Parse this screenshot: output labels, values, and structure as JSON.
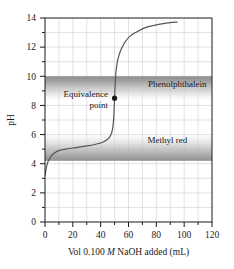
{
  "chart_data": {
    "type": "line",
    "title": "",
    "xlabel": "Vol 0.100 M NaOH added (mL)",
    "xlabel_parts": {
      "pre": "Vol 0.100 ",
      "italic": "M",
      "post": " NaOH added (mL)"
    },
    "ylabel": "pH",
    "xlim": [
      0,
      120
    ],
    "ylim": [
      0,
      14
    ],
    "xticks": [
      0,
      20,
      40,
      60,
      80,
      100,
      120
    ],
    "xtick_labels": [
      "0",
      "20",
      "40",
      "60",
      "80",
      "100",
      "120"
    ],
    "xminor_ticks": [
      10,
      30,
      50,
      70,
      90,
      110
    ],
    "yticks": [
      0,
      2,
      4,
      6,
      8,
      10,
      12,
      14
    ],
    "ytick_labels": [
      "0",
      "2",
      "4",
      "6",
      "8",
      "10",
      "12",
      "14"
    ],
    "yminor_ticks": [
      1,
      3,
      5,
      7,
      9,
      11,
      13
    ],
    "grid": true,
    "grid_x_step": 10,
    "grid_y_step": 1,
    "legend_position": "none",
    "series": [
      {
        "name": "Titration curve of weak acid with 0.100 M NaOH",
        "color": "#555555",
        "x": [
          0,
          1,
          2,
          3,
          4,
          5,
          7,
          10,
          15,
          20,
          25,
          30,
          35,
          40,
          43,
          45,
          46,
          47,
          48,
          49,
          49.5,
          50,
          50.5,
          51,
          52,
          53,
          54,
          55,
          56,
          57,
          58,
          60,
          62,
          65,
          68,
          70,
          75,
          80,
          85,
          90,
          95
        ],
        "y": [
          3.2,
          3.75,
          4.1,
          4.3,
          4.45,
          4.58,
          4.75,
          4.9,
          5.0,
          5.08,
          5.15,
          5.22,
          5.3,
          5.42,
          5.55,
          5.68,
          5.78,
          5.92,
          6.15,
          6.7,
          7.4,
          8.5,
          9.6,
          10.3,
          11.0,
          11.4,
          11.68,
          11.9,
          12.1,
          12.28,
          12.42,
          12.65,
          12.82,
          13.0,
          13.15,
          13.25,
          13.42,
          13.53,
          13.62,
          13.68,
          13.72
        ]
      }
    ],
    "annotations": [
      {
        "name": "equivalence-point",
        "label_line1": "Equivalence",
        "label_line2": "point",
        "x": 50,
        "y": 8.5,
        "marker": "filled-circle",
        "marker_color": "#1a1a1a"
      }
    ],
    "bands": [
      {
        "name": "phenolphthalein",
        "label": "Phenolphthalein",
        "ph_top": 10.0,
        "ph_bottom": 8.2,
        "gradient": "dark-at-top",
        "label_x": 95,
        "label_y": 9.45
      },
      {
        "name": "methyl-red",
        "label": "Methyl red",
        "ph_top": 6.2,
        "ph_bottom": 4.2,
        "gradient": "dark-at-bottom",
        "label_x": 88,
        "label_y": 5.6
      }
    ],
    "colors": {
      "curve": "#555555",
      "axis": "#1a1a1a",
      "grid": "#c9cdd4",
      "band_dark": "#8d8d8d",
      "band_light": "#f2f2f2",
      "marker": "#1a1a1a",
      "background": "#ffffff"
    }
  }
}
